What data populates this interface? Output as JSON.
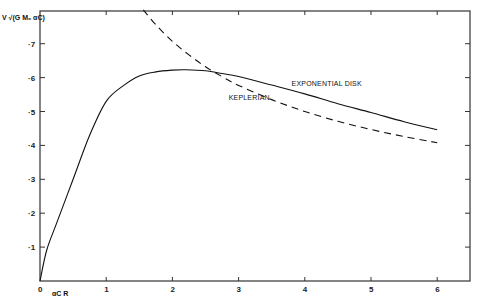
{
  "chart_data": {
    "type": "line",
    "title": "",
    "xlabel": "αC R",
    "ylabel": "V √(G M₀ αC)",
    "xlim": [
      0,
      6.5
    ],
    "ylim": [
      0,
      0.8
    ],
    "x_ticks": [
      "0",
      "1",
      "2",
      "3",
      "4",
      "5",
      "6"
    ],
    "y_ticks": [
      "0",
      "·1",
      "·2",
      "·3",
      "·4",
      "·5",
      "·6",
      "·7"
    ],
    "grid": false,
    "legend": "inline annotations",
    "annotations": [
      {
        "text": "EXPONENTIAL DISK",
        "x": 3.8,
        "y": 0.575
      },
      {
        "text": "KEPLERIAN",
        "x": 2.85,
        "y": 0.535
      }
    ],
    "series": [
      {
        "name": "EXPONENTIAL DISK",
        "style": "solid",
        "x": [
          0,
          0.1,
          0.25,
          0.5,
          0.75,
          1.0,
          1.25,
          1.5,
          1.75,
          2.0,
          2.2,
          2.5,
          2.75,
          3.0,
          3.5,
          4.0,
          4.5,
          5.0,
          5.5,
          6.0
        ],
        "values": [
          0,
          0.09,
          0.17,
          0.3,
          0.43,
          0.53,
          0.575,
          0.605,
          0.617,
          0.622,
          0.623,
          0.62,
          0.612,
          0.603,
          0.578,
          0.552,
          0.523,
          0.497,
          0.47,
          0.446
        ]
      },
      {
        "name": "KEPLERIAN",
        "style": "dashed",
        "x": [
          1.56,
          1.75,
          2.0,
          2.25,
          2.5,
          2.75,
          3.0,
          3.5,
          4.0,
          4.5,
          5.0,
          5.5,
          6.0
        ],
        "values": [
          0.8,
          0.756,
          0.707,
          0.667,
          0.632,
          0.603,
          0.577,
          0.535,
          0.5,
          0.471,
          0.447,
          0.426,
          0.408
        ]
      }
    ]
  }
}
